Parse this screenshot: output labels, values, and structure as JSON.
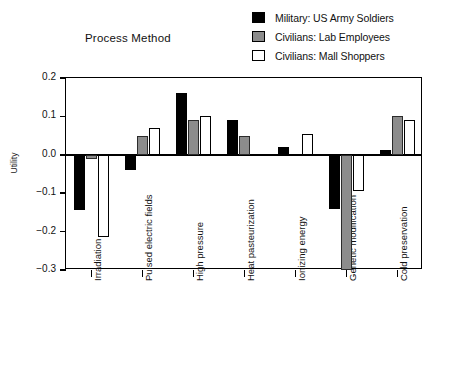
{
  "chart_data": {
    "type": "bar",
    "title": "Process Method",
    "xlabel": "",
    "ylabel": "Utility",
    "ylim": [
      -0.3,
      0.2
    ],
    "yticks": [
      0.2,
      0.1,
      0.0,
      -0.1,
      -0.2,
      -0.3
    ],
    "ytick_labels": [
      "0.2",
      "0.1",
      "0.0",
      "−0.1",
      "−0.2",
      "−0.3"
    ],
    "grid": false,
    "legend_position": "top-right",
    "categories": [
      "Irradiation",
      "Pulsed electric fields",
      "High pressure",
      "Heat pasteurization",
      "Ionizing energy",
      "Genetic modification",
      "Cold preservation"
    ],
    "series": [
      {
        "name": "Military: US Army Soldiers",
        "color": "#000000",
        "values": [
          -0.145,
          -0.04,
          0.16,
          0.09,
          0.02,
          -0.14,
          0.013
        ]
      },
      {
        "name": "Civilians: Lab Employees",
        "color": "#8c8c8c",
        "values": [
          -0.012,
          0.05,
          0.09,
          0.05,
          0.0,
          -0.3,
          0.1
        ]
      },
      {
        "name": "Civilians: Mall Shoppers",
        "color": "#ffffff",
        "values": [
          -0.215,
          0.07,
          0.1,
          0.0,
          0.055,
          -0.095,
          0.09
        ]
      }
    ]
  },
  "legend": {
    "items": [
      {
        "label": "Military: US Army Soldiers",
        "swatch": "sw-black"
      },
      {
        "label": "Civilians: Lab Employees",
        "swatch": "sw-gray"
      },
      {
        "label": "Civilians: Mall Shoppers",
        "swatch": "sw-white"
      }
    ]
  }
}
